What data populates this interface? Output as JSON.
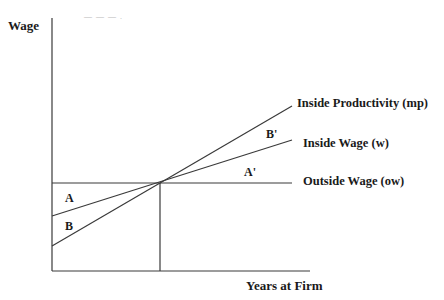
{
  "diagram": {
    "axes": {
      "y_label": "Wage",
      "x_label": "Years at Firm"
    },
    "curves": [
      {
        "id": "mp",
        "label": "Inside Productivity (mp)",
        "start": [
          52,
          246
        ],
        "end": [
          292,
          106
        ]
      },
      {
        "id": "w",
        "label": "Inside Wage  (w)",
        "start": [
          52,
          216
        ],
        "end": [
          292,
          140
        ]
      },
      {
        "id": "ow",
        "label": "Outside Wage  (ow)",
        "start": [
          52,
          183
        ],
        "end": [
          292,
          183
        ]
      }
    ],
    "regions": {
      "A": "A",
      "B": "B",
      "A_prime": "A'",
      "B_prime": "B'"
    },
    "intersection": [
      160,
      183
    ],
    "colors": {
      "line": "#3a3a3a",
      "text": "#1a1a1a",
      "background": "#ffffff"
    },
    "top_fragment": "— — — ."
  }
}
